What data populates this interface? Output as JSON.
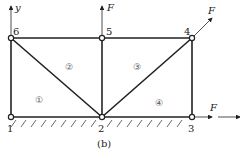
{
  "diagram": {
    "caption": "(b)",
    "axes": {
      "y_label": "y",
      "x_label": ""
    },
    "nodes": [
      {
        "id": "1",
        "label": "1",
        "x": 11,
        "y": 117
      },
      {
        "id": "2",
        "label": "2",
        "x": 102,
        "y": 117
      },
      {
        "id": "3",
        "label": "3",
        "x": 192,
        "y": 117
      },
      {
        "id": "4",
        "label": "4",
        "x": 192,
        "y": 38
      },
      {
        "id": "5",
        "label": "5",
        "x": 102,
        "y": 38
      },
      {
        "id": "6",
        "label": "6",
        "x": 11,
        "y": 38
      }
    ],
    "members": [
      [
        "1",
        "2"
      ],
      [
        "2",
        "3"
      ],
      [
        "3",
        "4"
      ],
      [
        "4",
        "5"
      ],
      [
        "5",
        "6"
      ],
      [
        "6",
        "1"
      ],
      [
        "6",
        "2"
      ],
      [
        "2",
        "5"
      ],
      [
        "2",
        "4"
      ]
    ],
    "elements": [
      {
        "label": "①",
        "x": 40,
        "y": 99
      },
      {
        "label": "②",
        "x": 70,
        "y": 66
      },
      {
        "label": "③",
        "x": 138,
        "y": 66
      },
      {
        "label": "④",
        "x": 160,
        "y": 102
      }
    ],
    "forces": [
      {
        "label": "F",
        "at_node": "5",
        "direction": "up"
      },
      {
        "label": "F",
        "at_node": "4",
        "direction": "up-right 45°"
      },
      {
        "label": "F",
        "at_node": "3",
        "direction": "right"
      }
    ],
    "support": "ground hatching along bottom chord 1–3"
  }
}
